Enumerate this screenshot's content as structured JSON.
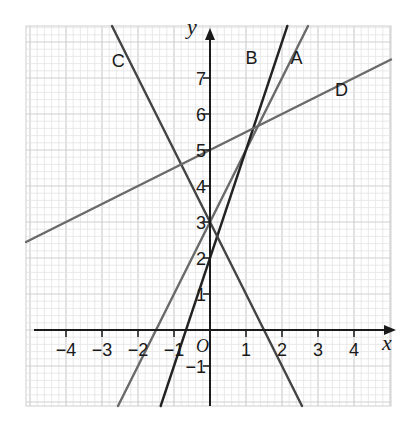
{
  "chart_data": {
    "type": "line",
    "title": "",
    "xlabel": "x",
    "ylabel": "y",
    "origin_label": "O",
    "xlim": [
      -5.1,
      5.0
    ],
    "ylim": [
      -2.1,
      8.45
    ],
    "grid": true,
    "grid_minor_step": 0.2,
    "grid_major_step": 1,
    "x_ticks": [
      -4,
      -3,
      -2,
      -1,
      1,
      2,
      3,
      4
    ],
    "x_tick_labels": [
      "−4",
      "−3",
      "−2",
      "−1",
      "1",
      "2",
      "3",
      "4"
    ],
    "y_ticks": [
      -1,
      1,
      2,
      3,
      4,
      5,
      6,
      7
    ],
    "y_tick_labels": [
      "−1",
      "1",
      "2",
      "3",
      "4",
      "5",
      "6",
      "7"
    ],
    "series": [
      {
        "name": "A",
        "equation": "y = 2x + 3",
        "slope": 2,
        "intercept": 3,
        "color": "#6a6a6a",
        "label_pos": [
          2.4,
          7.4
        ]
      },
      {
        "name": "B",
        "equation": "y = 3x + 2",
        "slope": 3,
        "intercept": 2,
        "color": "#222222",
        "label_pos": [
          1.15,
          7.4
        ]
      },
      {
        "name": "C",
        "equation": "y = -2x + 3",
        "slope": -2,
        "intercept": 3,
        "color": "#444444",
        "label_pos": [
          -2.55,
          7.3
        ]
      },
      {
        "name": "D",
        "equation": "y = 0.5x + 5",
        "slope": 0.5,
        "intercept": 5,
        "color": "#6a6a6a",
        "label_pos": [
          3.65,
          6.5
        ]
      }
    ],
    "legend": "inline labels",
    "annotations": []
  },
  "colors": {
    "axis": "#1a1a1a",
    "grid_minor": "#e4e4e4",
    "grid_major": "#cfcfcf"
  }
}
